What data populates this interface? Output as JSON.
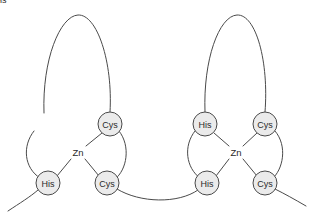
{
  "figure": {
    "background_color": "#ffffff",
    "stroke_color": "#4a4a4a",
    "node_fill_color": "#ebebeb",
    "text_color": "#2a2a2a"
  },
  "fingers": [
    {
      "id": "finger-1",
      "metal": {
        "label": "Zn",
        "x": 78,
        "y": 152
      },
      "residues": [
        {
          "id": "f1-cys-top",
          "label": "Cys",
          "x": 44,
          "y": 125,
          "r": 12
        },
        {
          "id": "f1-his-top",
          "label": "His",
          "x": 110,
          "y": 124,
          "r": 12
        },
        {
          "id": "f1-cys-bot",
          "label": "Cys",
          "x": 48,
          "y": 183,
          "r": 12
        },
        {
          "id": "f1-his-bot",
          "label": "His",
          "x": 107,
          "y": 183,
          "r": 12
        }
      ]
    },
    {
      "id": "finger-2",
      "metal": {
        "label": "Zn",
        "x": 236,
        "y": 152
      },
      "residues": [
        {
          "id": "f2-cys-top",
          "label": "Cys",
          "x": 205,
          "y": 124,
          "r": 12
        },
        {
          "id": "f2-his-top",
          "label": "His",
          "x": 265,
          "y": 124,
          "r": 12
        },
        {
          "id": "f2-cys-bot",
          "label": "Cys",
          "x": 207,
          "y": 183,
          "r": 12
        },
        {
          "id": "f2-his-bot",
          "label": "His",
          "x": 265,
          "y": 183,
          "r": 12
        }
      ]
    }
  ],
  "backbone_segments": [
    {
      "id": "f1-top-loop",
      "d": "M 44 113 C 42 60 60 16 78 15 C 97 14 113 62 110 112"
    },
    {
      "id": "f1-cys-arc",
      "d": "M 34 131 C 22 146 24 168 40 178"
    },
    {
      "id": "f1-his-arc",
      "d": "M 119 131 C 131 146 127 170 115 179"
    },
    {
      "id": "f1-left-tail",
      "d": "M 38 190 C 30 197 20 203 8 211"
    },
    {
      "id": "inter-finger-linker",
      "d": "M 117 189 C 140 203 178 204 198 190"
    },
    {
      "id": "f2-top-loop",
      "d": "M 205 112 C 203 60 219 16 237 15 C 256 14 269 62 265 112"
    },
    {
      "id": "f2-cys-arc",
      "d": "M 195 131 C 183 146 186 168 200 178"
    },
    {
      "id": "f2-his-arc",
      "d": "M 275 131 C 288 146 283 170 272 179"
    },
    {
      "id": "f2-right-tail",
      "d": "M 275 189 C 285 194 294 199 306 206"
    }
  ],
  "coordination_bonds": [
    {
      "id": "bond-f1-cys-top",
      "x1": 53,
      "y1": 133,
      "x2": 70,
      "y2": 146
    },
    {
      "id": "bond-f1-his-top",
      "x1": 102,
      "y1": 133,
      "x2": 86,
      "y2": 146
    },
    {
      "id": "bond-f1-cys-bot",
      "x1": 57,
      "y1": 176,
      "x2": 71,
      "y2": 159
    },
    {
      "id": "bond-f1-his-bot",
      "x1": 99,
      "y1": 176,
      "x2": 85,
      "y2": 159
    },
    {
      "id": "bond-f2-cys-top",
      "x1": 214,
      "y1": 133,
      "x2": 229,
      "y2": 146
    },
    {
      "id": "bond-f2-his-top",
      "x1": 257,
      "y1": 133,
      "x2": 243,
      "y2": 146
    },
    {
      "id": "bond-f2-cys-bot",
      "x1": 216,
      "y1": 176,
      "x2": 229,
      "y2": 159
    },
    {
      "id": "bond-f2-his-bot",
      "x1": 257,
      "y1": 176,
      "x2": 243,
      "y2": 159
    }
  ]
}
